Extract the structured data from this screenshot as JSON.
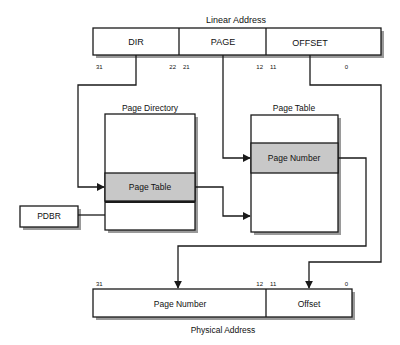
{
  "diagram": {
    "linear_address": {
      "title": "Linear Address",
      "fields": [
        {
          "label": "DIR",
          "bit_high": "31",
          "bit_low": "22"
        },
        {
          "label": "PAGE",
          "bit_high": "21",
          "bit_low": "12"
        },
        {
          "label": "OFFSET",
          "bit_high": "11",
          "bit_low": "0"
        }
      ]
    },
    "page_directory": {
      "title": "Page Directory",
      "entry_label": "Page Table"
    },
    "page_table": {
      "title": "Page Table",
      "entry_label": "Page Number"
    },
    "pdbr": {
      "label": "PDBR"
    },
    "physical_address": {
      "title": "Physical Address",
      "fields": [
        {
          "label": "Page Number",
          "bit_high": "31",
          "bit_low": "12"
        },
        {
          "label": "Offset",
          "bit_high": "11",
          "bit_low": "0"
        }
      ]
    },
    "colors": {
      "line": "#1a1a1a",
      "highlight": "#c8c8c8",
      "shadow": "#9a9a9a",
      "background": "#ffffff"
    }
  }
}
